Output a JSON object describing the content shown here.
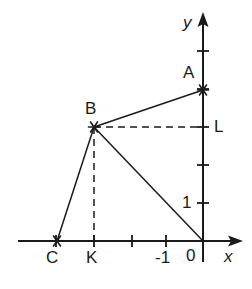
{
  "figure": {
    "background_color": "#ffffff",
    "stroke_color": "#1a1a1a",
    "width": 252,
    "height": 289
  },
  "axes": {
    "x_axis": {
      "label": "x",
      "origin_label": "0",
      "tick_labels": [
        "-1"
      ],
      "line_y": 241,
      "start_x": 18,
      "end_x": 243,
      "arrow": "right",
      "tick_positions_px": [
        56,
        94,
        132,
        166,
        203
      ],
      "unit_px": 38
    },
    "y_axis": {
      "label": "y",
      "tick_labels": [
        "1"
      ],
      "line_x": 203,
      "start_y": 12,
      "end_y": 262,
      "arrow": "up",
      "tick_positions_px": [
        51,
        89,
        127,
        165,
        203
      ],
      "unit_px": 38
    }
  },
  "points": [
    {
      "name": "A",
      "label": "A",
      "x_px": 203,
      "y_px": 90,
      "label_x_px": 183,
      "label_y_px": 64,
      "marker": "star"
    },
    {
      "name": "B",
      "label": "B",
      "x_px": 94,
      "y_px": 127,
      "label_x_px": 85,
      "label_y_px": 100,
      "marker": "star"
    },
    {
      "name": "C",
      "label": "C",
      "x_px": 57,
      "y_px": 241,
      "label_x_px": 46,
      "label_y_px": 249,
      "marker": "star"
    },
    {
      "name": "K",
      "label": "K",
      "x_px": 94,
      "y_px": 241,
      "label_x_px": 86,
      "label_y_px": 249,
      "marker": "tick"
    },
    {
      "name": "L",
      "label": "L",
      "x_px": 203,
      "y_px": 127,
      "label_x_px": 214,
      "label_y_px": 118,
      "marker": "tick"
    },
    {
      "name": "O",
      "label": "0",
      "x_px": 203,
      "y_px": 241,
      "label_x_px": 186,
      "label_y_px": 247,
      "marker": "none"
    }
  ],
  "segments": [
    {
      "name": "segment-AB",
      "from": "B",
      "to": "A",
      "style": "solid"
    },
    {
      "name": "segment-BC",
      "from": "B",
      "to": "C",
      "style": "solid"
    },
    {
      "name": "segment-BO",
      "from": "B",
      "to": "O",
      "style": "solid"
    },
    {
      "name": "segment-BL",
      "from": "B",
      "to": "L",
      "style": "dashed"
    },
    {
      "name": "segment-BK",
      "from": "B",
      "to": "K",
      "style": "dashed"
    }
  ],
  "axis_tick_label_x": {
    "minus_one": "-1",
    "label_x_px": 155,
    "label_y_px": 249
  },
  "axis_tick_label_y": {
    "one": "1",
    "label_x_px": 182,
    "label_y_px": 194
  }
}
